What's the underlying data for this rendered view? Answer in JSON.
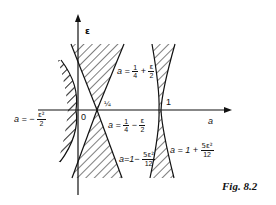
{
  "figure": {
    "caption": "Fig. 8.2",
    "axes": {
      "horizontal_label": "a",
      "vertical_label": "ε",
      "origin_label": "0",
      "tick_quarter": "¼",
      "tick_one": "1"
    },
    "curves": {
      "left": {
        "lhs": "a = −",
        "num": "ε²",
        "den": "2"
      },
      "upper_wedge": {
        "lhs": "a =",
        "num1": "1",
        "den1": "4",
        "op": "+",
        "num2": "ε",
        "den2": "2"
      },
      "lower_wedge": {
        "lhs": "a =",
        "num1": "1",
        "den1": "4",
        "op": "−",
        "num2": "ε",
        "den2": "2"
      },
      "left_of_one": {
        "lhs": "a=1−",
        "num": "5ε²",
        "den": "12"
      },
      "right_of_one": {
        "lhs": "a = 1 +",
        "num": "5ε²",
        "den": "12"
      }
    },
    "colors": {
      "ink": "#111111",
      "background": "#ffffff"
    }
  }
}
